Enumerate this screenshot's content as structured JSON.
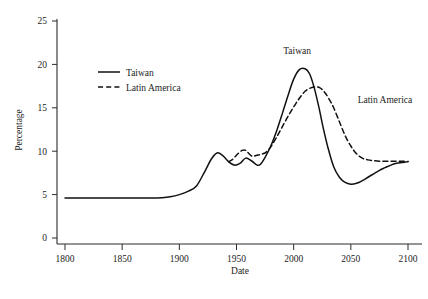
{
  "chart_data": {
    "type": "line",
    "title": "",
    "xlabel": "Date",
    "ylabel": "Percentage",
    "xlim": [
      1790,
      2110
    ],
    "ylim": [
      0,
      26
    ],
    "grid": false,
    "legend_position": "upper-left-inside",
    "xticks": [
      1800,
      1850,
      1900,
      1950,
      2000,
      2050,
      2100
    ],
    "xtick_labels": [
      "1800",
      "1850",
      "1900",
      "1950",
      "2000",
      "2050",
      "2100"
    ],
    "yticks": [
      0,
      5,
      10,
      15,
      20,
      25
    ],
    "ytick_labels": [
      "0",
      "5",
      "10",
      "15",
      "20",
      "25"
    ],
    "series": [
      {
        "name": "Taiwan",
        "style": "solid",
        "color": "#111111",
        "annotation": "Taiwan",
        "annotation_point": [
          2003,
          21.2
        ],
        "x": [
          1800,
          1820,
          1840,
          1860,
          1875,
          1885,
          1892,
          1900,
          1908,
          1915,
          1922,
          1928,
          1933,
          1938,
          1943,
          1948,
          1953,
          1958,
          1963,
          1968,
          1971,
          1975,
          1980,
          1985,
          1990,
          1995,
          2000,
          2005,
          2010,
          2014,
          2018,
          2022,
          2026,
          2030,
          2035,
          2040,
          2045,
          2050,
          2055,
          2060,
          2065,
          2070,
          2075,
          2080,
          2085,
          2090,
          2095,
          2100
        ],
        "y": [
          4.6,
          4.6,
          4.6,
          4.6,
          4.6,
          4.65,
          4.75,
          5.0,
          5.4,
          6.0,
          7.6,
          9.1,
          9.8,
          9.5,
          8.8,
          8.4,
          8.6,
          9.2,
          8.9,
          8.4,
          8.5,
          9.3,
          10.6,
          12.3,
          14.3,
          16.4,
          18.3,
          19.4,
          19.5,
          18.9,
          17.3,
          15.1,
          12.6,
          10.4,
          8.2,
          7.0,
          6.4,
          6.2,
          6.3,
          6.6,
          7.0,
          7.4,
          7.8,
          8.1,
          8.4,
          8.6,
          8.7,
          8.8
        ]
      },
      {
        "name": "Latin America",
        "style": "dashed",
        "color": "#111111",
        "annotation": "Latin America",
        "annotation_point": [
          2056,
          15.6
        ],
        "x": [
          1943,
          1946,
          1949,
          1952,
          1955,
          1958,
          1961,
          1964,
          1967,
          1970,
          1973,
          1976,
          1980,
          1985,
          1990,
          1995,
          2000,
          2005,
          2010,
          2015,
          2019,
          2023,
          2027,
          2031,
          2035,
          2040,
          2045,
          2050,
          2055,
          2060,
          2065,
          2070,
          2075,
          2080,
          2085,
          2090,
          2095,
          2100
        ],
        "y": [
          8.8,
          9.0,
          9.4,
          9.8,
          10.1,
          10.1,
          9.7,
          9.4,
          9.5,
          9.6,
          9.7,
          9.9,
          10.5,
          11.6,
          12.8,
          14.0,
          15.1,
          16.1,
          16.9,
          17.3,
          17.4,
          17.3,
          16.8,
          16.0,
          15.0,
          13.4,
          11.8,
          10.6,
          9.7,
          9.2,
          9.0,
          8.9,
          8.85,
          8.85,
          8.85,
          8.85,
          8.85,
          8.8
        ]
      }
    ],
    "legend": [
      {
        "label": "Taiwan",
        "style": "solid"
      },
      {
        "label": "Latin America",
        "style": "dashed"
      }
    ],
    "peaks": {
      "taiwan_peak_value": 19.5,
      "taiwan_peak_year": 2009,
      "taiwan_trough_value": 6.2,
      "taiwan_trough_year": 2050,
      "latin_america_peak_value": 17.4,
      "latin_america_peak_year": 2019,
      "baseline_value": 4.6,
      "convergence_value": 8.8
    }
  }
}
